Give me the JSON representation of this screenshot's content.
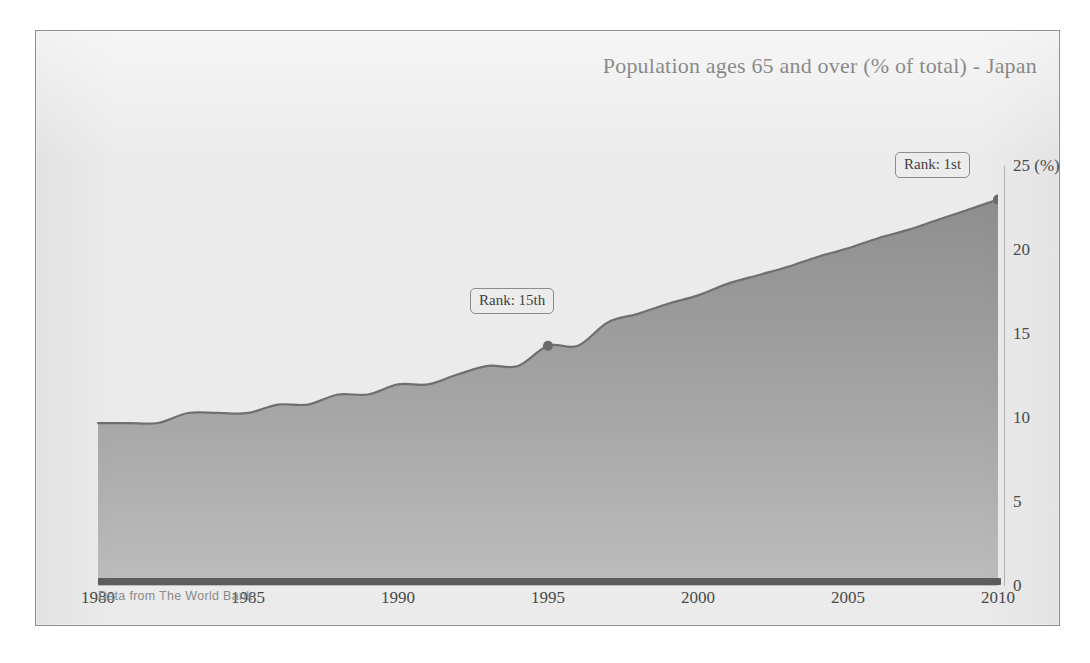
{
  "card": {
    "title": "Population ages 65 and over (% of total) - Japan",
    "footer": "Data from The World Bank"
  },
  "annotations": {
    "start_label": "Rank: 15th",
    "end_label": "Rank: 1st"
  },
  "colors": {
    "card_background": "#ebebeb",
    "card_border": "#8e8e8e",
    "area_top": "#8c8c8c",
    "area_bottom": "#b9b9b9",
    "line": "#6b6b6b",
    "axis": "#5d5d5d",
    "tick_text": "#4a4a4a",
    "title_text": "#3b3b3b",
    "footer_text": "#8a8a8a"
  },
  "chart_data": {
    "type": "area",
    "title": "Population ages 65 and over (% of total) - Japan",
    "xlabel": "",
    "ylabel": "25 (%)",
    "xlim": [
      1980,
      2010
    ],
    "ylim": [
      0,
      25
    ],
    "grid": false,
    "legend": "none",
    "x_ticks": [
      "1980",
      "1985",
      "1990",
      "1995",
      "2000",
      "2005",
      "2010"
    ],
    "x_tick_values": [
      1980,
      1985,
      1990,
      1995,
      2000,
      2005,
      2010
    ],
    "y_ticks": [
      "0",
      "5",
      "10",
      "15",
      "20",
      "25 (%)"
    ],
    "y_tick_values": [
      0,
      5,
      10,
      15,
      20,
      25
    ],
    "x": [
      1980,
      1981,
      1982,
      1983,
      1984,
      1985,
      1986,
      1987,
      1988,
      1989,
      1990,
      1991,
      1992,
      1993,
      1994,
      1995,
      1996,
      1997,
      1998,
      1999,
      2000,
      2001,
      2002,
      2003,
      2004,
      2005,
      2006,
      2007,
      2008,
      2009,
      2010
    ],
    "values": [
      9.7,
      9.7,
      9.7,
      10.3,
      10.3,
      10.3,
      10.8,
      10.8,
      11.4,
      11.4,
      12.0,
      12.0,
      12.6,
      13.1,
      13.1,
      14.3,
      14.3,
      15.7,
      16.2,
      16.8,
      17.3,
      18.0,
      18.5,
      19.0,
      19.6,
      20.1,
      20.7,
      21.2,
      21.8,
      22.4,
      23.0
    ],
    "series": [
      {
        "name": "Population ages 65 and over (% of total) - Japan",
        "values": [
          9.7,
          9.7,
          9.7,
          10.3,
          10.3,
          10.3,
          10.8,
          10.8,
          11.4,
          11.4,
          12.0,
          12.0,
          12.6,
          13.1,
          13.1,
          14.3,
          14.3,
          15.7,
          16.2,
          16.8,
          17.3,
          18.0,
          18.5,
          19.0,
          19.6,
          20.1,
          20.7,
          21.2,
          21.8,
          22.4,
          23.0
        ]
      }
    ],
    "markers": [
      {
        "x": 1995,
        "y": 14.3,
        "label": "Rank: 15th"
      },
      {
        "x": 2010,
        "y": 23.0,
        "label": "Rank: 1st"
      }
    ]
  }
}
